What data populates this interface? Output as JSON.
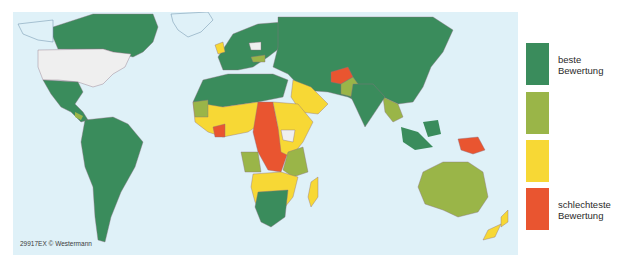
{
  "map": {
    "ocean_color": "#dff1f8",
    "nodata_color": "#efefef",
    "border_color": "#8a6f80",
    "credit": "29917EX © Westermann"
  },
  "legend": {
    "items": [
      {
        "color": "#3a8c5c",
        "label_line1": "beste",
        "label_line2": "Bewertung"
      },
      {
        "color": "#9ab548",
        "label_line1": "",
        "label_line2": ""
      },
      {
        "color": "#f7d835",
        "label_line1": "",
        "label_line2": ""
      },
      {
        "color": "#e95530",
        "label_line1": "schlechteste",
        "label_line2": "Bewertung"
      }
    ]
  }
}
